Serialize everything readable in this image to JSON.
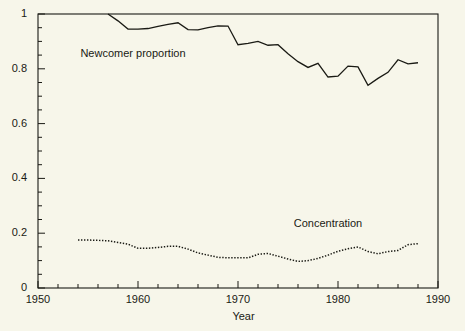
{
  "chart_data": {
    "type": "line",
    "title": "",
    "xlabel": "Year",
    "ylabel": "",
    "xlim": [
      1950,
      1990
    ],
    "ylim": [
      0,
      1
    ],
    "grid": false,
    "legend_position": "inline-annotations",
    "x_ticks": [
      1950,
      1960,
      1970,
      1980,
      1990
    ],
    "x_tick_labels": [
      "1950",
      "1960",
      "1970",
      "1980",
      "1990"
    ],
    "x_minor_step": 2,
    "y_ticks": [
      0,
      0.2,
      0.4,
      0.6,
      0.8,
      1
    ],
    "y_tick_labels": [
      "0",
      "0.2",
      "0.4",
      "0.6",
      "0.8",
      "1"
    ],
    "y_minor_step": 0.05,
    "annotations": [
      {
        "text": "Newcomer proportion",
        "x": 1959.5,
        "y": 0.855
      },
      {
        "text": "Concentration",
        "x": 1979.0,
        "y": 0.233
      }
    ],
    "series": [
      {
        "name": "Newcomer proportion",
        "style": "solid",
        "color": "#1a1a14",
        "x": [
          1957,
          1958,
          1959,
          1960,
          1961,
          1962,
          1963,
          1964,
          1965,
          1966,
          1967,
          1968,
          1969,
          1970,
          1971,
          1972,
          1973,
          1974,
          1975,
          1976,
          1977,
          1978,
          1979,
          1980,
          1981,
          1982,
          1983,
          1984,
          1985,
          1986,
          1987,
          1988
        ],
        "values": [
          1.0,
          0.975,
          0.945,
          0.945,
          0.947,
          0.955,
          0.962,
          0.968,
          0.943,
          0.942,
          0.95,
          0.957,
          0.956,
          0.888,
          0.893,
          0.9,
          0.886,
          0.888,
          0.855,
          0.826,
          0.805,
          0.82,
          0.77,
          0.773,
          0.81,
          0.807,
          0.74,
          0.765,
          0.787,
          0.833,
          0.818,
          0.822
        ]
      },
      {
        "name": "Concentration",
        "style": "dotted",
        "color": "#1a1a14",
        "x": [
          1954,
          1955,
          1956,
          1957,
          1958,
          1959,
          1960,
          1961,
          1962,
          1963,
          1964,
          1965,
          1966,
          1967,
          1968,
          1969,
          1970,
          1971,
          1972,
          1973,
          1974,
          1975,
          1976,
          1977,
          1978,
          1979,
          1980,
          1981,
          1982,
          1983,
          1984,
          1985,
          1986,
          1987,
          1988
        ],
        "values": [
          0.175,
          0.175,
          0.174,
          0.172,
          0.166,
          0.16,
          0.145,
          0.145,
          0.148,
          0.152,
          0.152,
          0.142,
          0.128,
          0.12,
          0.112,
          0.11,
          0.11,
          0.11,
          0.123,
          0.126,
          0.116,
          0.106,
          0.097,
          0.1,
          0.108,
          0.12,
          0.134,
          0.143,
          0.15,
          0.133,
          0.125,
          0.133,
          0.137,
          0.158,
          0.162
        ]
      }
    ]
  },
  "axis": {
    "x_title": "Year"
  }
}
